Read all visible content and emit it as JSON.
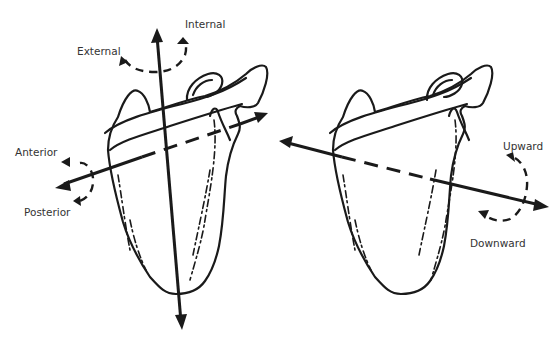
{
  "figure": {
    "left_scapula": {
      "axes": [
        {
          "name": "vertical-axis",
          "direction": "superior-inferior"
        },
        {
          "name": "anteroposterior-axis",
          "direction": "anterior-posterior"
        }
      ],
      "labels": {
        "internal": "Internal",
        "external": "External",
        "anterior": "Anterior",
        "posterior": "Posterior"
      }
    },
    "right_scapula": {
      "axes": [
        {
          "name": "mediolateral-axis",
          "direction": "medial-lateral"
        }
      ],
      "labels": {
        "upward": "Upward",
        "downward": "Downward"
      }
    },
    "colors": {
      "stroke": "#1a1a1a",
      "text": "#333333",
      "background": "#ffffff"
    }
  }
}
